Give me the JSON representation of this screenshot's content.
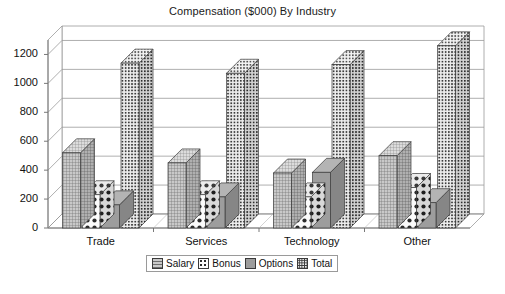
{
  "chart_data": {
    "type": "bar",
    "title": "Compensation ($000) By Industry",
    "xlabel": "",
    "ylabel": "",
    "categories": [
      "Trade",
      "Services",
      "Technology",
      "Other"
    ],
    "series": [
      {
        "name": "Salary",
        "values": [
          520,
          450,
          380,
          500
        ],
        "pattern": "crosshatch",
        "color": "#b8b8b8"
      },
      {
        "name": "Bonus",
        "values": [
          230,
          230,
          215,
          280
        ],
        "pattern": "polka-dots",
        "color": "#4a4a4a"
      },
      {
        "name": "Options",
        "values": [
          160,
          215,
          385,
          175
        ],
        "pattern": "solid",
        "color": "#9a9a9a"
      },
      {
        "name": "Total",
        "values": [
          1140,
          1070,
          1130,
          1260
        ],
        "pattern": "dot-grid",
        "color": "#c4c4c4"
      }
    ],
    "ylim": [
      0,
      1300
    ],
    "yticks": [
      0,
      200,
      400,
      600,
      800,
      1000,
      1200
    ],
    "ytick_labels": [
      "0",
      "200",
      "400",
      "600",
      "800",
      "1000",
      "1200"
    ],
    "grid": true,
    "legend_position": "bottom",
    "projection": "3d-bar"
  },
  "legend": {
    "entries": [
      {
        "label": "Salary"
      },
      {
        "label": "Bonus"
      },
      {
        "label": "Options"
      },
      {
        "label": "Total"
      }
    ]
  }
}
